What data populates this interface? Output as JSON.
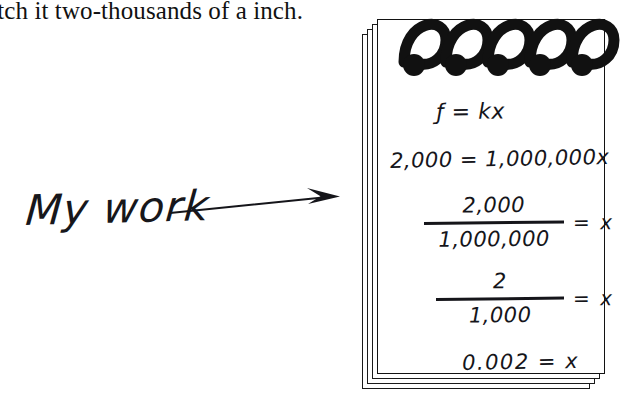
{
  "page": {
    "background_color": "#ffffff",
    "ink_color": "#15151a",
    "width": 626,
    "height": 399
  },
  "printed_text": {
    "line": "etch it two-thousands of a inch."
  },
  "annotation": {
    "label": "My work",
    "arrow_icon": "arrow-right-icon"
  },
  "notepad": {
    "binding_icon": "spiral-binding-icon",
    "spiral_count": 5,
    "page_stack_count": 4,
    "lines": [
      {
        "id": "formula",
        "type": "equation",
        "text": "ƒ = kx"
      },
      {
        "id": "substitute",
        "type": "equation",
        "text": "2,000 = 1,000,000x"
      },
      {
        "id": "divide-1",
        "type": "fraction",
        "numerator": "2,000",
        "denominator": "1,000,000",
        "rhs": "= x"
      },
      {
        "id": "divide-2",
        "type": "fraction",
        "numerator": "2",
        "denominator": "1,000",
        "rhs": "= x"
      },
      {
        "id": "result",
        "type": "equation",
        "text": "0.002 = x"
      }
    ]
  }
}
